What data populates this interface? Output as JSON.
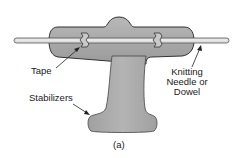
{
  "diagram": {
    "labels": {
      "tape": "Tape",
      "needle_line1": "Knitting",
      "needle_line2": "Needle or",
      "needle_line3": "Dowel",
      "stabilizers": "Stabilizers",
      "caption": "(a)"
    },
    "colors": {
      "body_fill": "#a6a6a6",
      "body_stroke": "#333333",
      "needle_fill": "#dcdcdc",
      "tape_fill": "#c8c8c8",
      "text": "#222222"
    }
  }
}
